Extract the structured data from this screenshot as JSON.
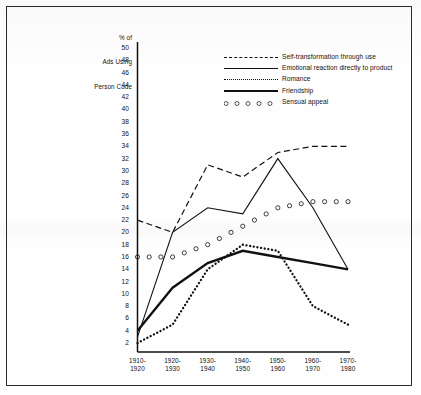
{
  "chart_data": {
    "type": "line",
    "title": "",
    "ylabel": "% of\nAds Using\nPerson Code",
    "xlabel": "",
    "ylim": [
      0,
      50
    ],
    "ytick_values": [
      50,
      48,
      46,
      44,
      42,
      40,
      38,
      36,
      34,
      32,
      30,
      28,
      26,
      24,
      22,
      20,
      18,
      16,
      14,
      12,
      10,
      8,
      6,
      4,
      2
    ],
    "grid": false,
    "legend_position": "top-right",
    "categories": [
      "1910-\n1920",
      "1920-\n1930",
      "1930-\n1940",
      "1940-\n1950",
      "1950-\n1960",
      "1960-\n1970",
      "1970-\n1980"
    ],
    "series": [
      {
        "name": "Self-transformation through use",
        "style": "dashed",
        "values": [
          22,
          20,
          31,
          29,
          33,
          34,
          34
        ]
      },
      {
        "name": "Emotional reaction directly to product",
        "style": "solid-thin",
        "values": [
          3,
          20,
          24,
          23,
          32,
          24,
          14
        ]
      },
      {
        "name": "Romance",
        "style": "dotted",
        "values": [
          2,
          5,
          14,
          18,
          17,
          8,
          5
        ]
      },
      {
        "name": "Friendship",
        "style": "solid-thick",
        "values": [
          4,
          11,
          15,
          17,
          16,
          15,
          14
        ]
      },
      {
        "name": "Sensual appeal",
        "style": "circles",
        "values": [
          16,
          16,
          18,
          21,
          24,
          25,
          25
        ]
      }
    ]
  },
  "axis": {
    "y_title_line1": "% of",
    "y_title_line2": "Ads Using",
    "y_title_line3": "Person Code"
  },
  "legend": {
    "items": [
      {
        "label": "Self-transformation through use",
        "style": "dashed"
      },
      {
        "label": "Emotional reaction directly to product",
        "style": "solid-thin"
      },
      {
        "label": "Romance",
        "style": "dotted"
      },
      {
        "label": "Friendship",
        "style": "solid-thick"
      },
      {
        "label": "Sensual appeal",
        "style": "circles"
      }
    ]
  },
  "colors": {
    "ink": "#111111",
    "frame": "#2a2a2a",
    "paper": "#fefefe"
  }
}
